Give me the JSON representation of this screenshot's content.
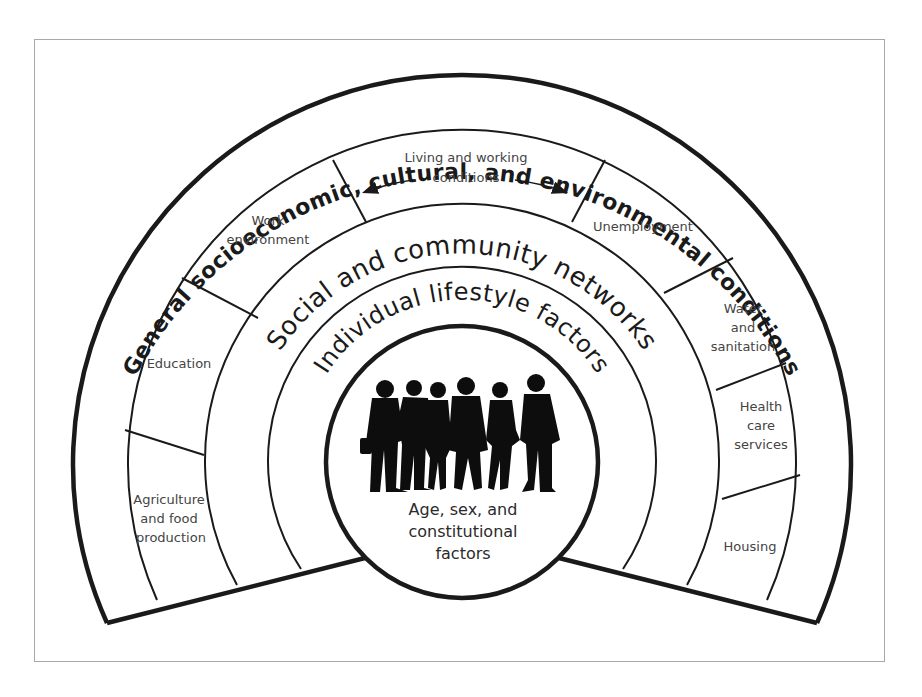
{
  "diagram": {
    "outer_layer": {
      "label": "General socioeconomic, cultural, and environmental conditions"
    },
    "living_working_layer": {
      "header": {
        "line1": "Living and working",
        "line2": "conditions"
      },
      "segments": [
        {
          "lines": [
            "Agriculture",
            "and food",
            "production"
          ]
        },
        {
          "lines": [
            "Education"
          ]
        },
        {
          "lines": [
            "Work",
            "environment"
          ]
        },
        {
          "lines": [
            "Unemployment"
          ]
        },
        {
          "lines": [
            "Water",
            "and",
            "sanitation"
          ]
        },
        {
          "lines": [
            "Health",
            "care",
            "services"
          ]
        },
        {
          "lines": [
            "Housing"
          ]
        }
      ]
    },
    "social_layer": {
      "label": "Social and community networks"
    },
    "individual_layer": {
      "label": "Individual lifestyle factors"
    },
    "core": {
      "icon": "group-of-people-silhouette",
      "lines": [
        "Age, sex, and",
        "constitutional",
        "factors"
      ]
    }
  },
  "colors": {
    "line": "#1a1a1a",
    "label_text": "#444444",
    "frame": "#a8a8a8",
    "background": "#ffffff"
  }
}
